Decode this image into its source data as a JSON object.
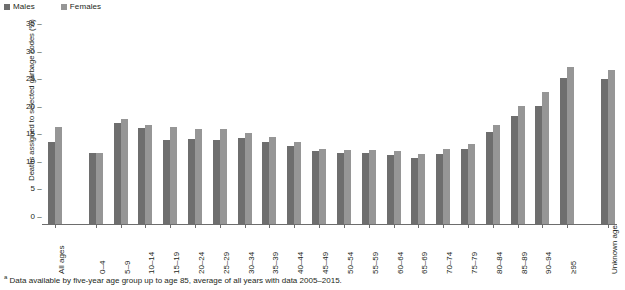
{
  "legend": {
    "items": [
      {
        "label": "Males",
        "color": "#6e6e6e"
      },
      {
        "label": "Females",
        "color": "#969696"
      }
    ]
  },
  "footnote": {
    "marker": "a",
    "text": "Data available by five-year age group up to age 85, average of all years with data 2005–2015."
  },
  "chart_data": {
    "type": "bar",
    "title": "",
    "xlabel": "",
    "ylabel": "Deaths assigned to selected garbage codes (%)",
    "ylim": [
      0,
      35
    ],
    "yticks": [
      0,
      5,
      10,
      15,
      20,
      25,
      30,
      35
    ],
    "ytick_labels": [
      "0",
      "5",
      "10",
      "15",
      "20",
      "25",
      "30",
      "35"
    ],
    "grid": false,
    "legend_position": "top-left",
    "categories": [
      "All ages",
      "0–4",
      "5–9",
      "10–14",
      "15–19",
      "20–24",
      "25–29",
      "30–34",
      "35–39",
      "40–44",
      "45–49",
      "50–54",
      "55–59",
      "60–64",
      "65–69",
      "70–74",
      "75–79",
      "80–84",
      "85–89",
      "90–94",
      "≥95",
      "Unknown age"
    ],
    "series": [
      {
        "name": "Males",
        "color": "#6e6e6e",
        "values": [
          15.0,
          13.0,
          18.3,
          17.5,
          15.2,
          15.5,
          15.3,
          15.7,
          15.0,
          14.2,
          13.3,
          13.0,
          13.0,
          12.6,
          12.0,
          12.8,
          13.6,
          16.7,
          19.6,
          21.5,
          26.5,
          26.3
        ]
      },
      {
        "name": "Females",
        "color": "#969696",
        "values": [
          17.7,
          13.0,
          19.0,
          18.0,
          17.7,
          17.3,
          17.2,
          16.5,
          15.8,
          15.0,
          13.7,
          13.5,
          13.4,
          13.3,
          12.7,
          13.7,
          14.6,
          18.0,
          21.4,
          23.9,
          28.6,
          28.0
        ]
      }
    ],
    "group_gaps_after": [
      0,
      20
    ]
  }
}
